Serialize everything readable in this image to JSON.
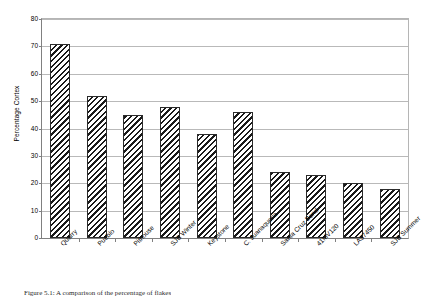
{
  "figure": {
    "caption": "Figure 5.1: A comparison of the percentage of flakes"
  },
  "chart_data": {
    "type": "bar",
    "title": "",
    "xlabel": "",
    "ylabel": "Percentage Cortex",
    "ylim": [
      0,
      80
    ],
    "ytick_step": 10,
    "ytick_labels": [
      "80",
      "70",
      "60",
      "50",
      "40",
      "30",
      "20",
      "10",
      "0"
    ],
    "grid": true,
    "legend": "none",
    "categories": [
      "Quarry",
      "Pueblo",
      "Pithouse",
      "SJB Winter",
      "Keystone",
      "C. Juanaquena",
      "Santa Cruz Bend",
      "41MV120",
      "LA37450",
      "SJB Summer"
    ],
    "values": [
      71,
      52,
      45,
      48,
      38,
      46,
      24,
      23,
      20,
      18
    ],
    "bar_fill": "diagonal-hatch",
    "bar_edge_color": "#2b2b2b",
    "grid_color": "#b9b9b9",
    "axis_color": "#808080"
  }
}
